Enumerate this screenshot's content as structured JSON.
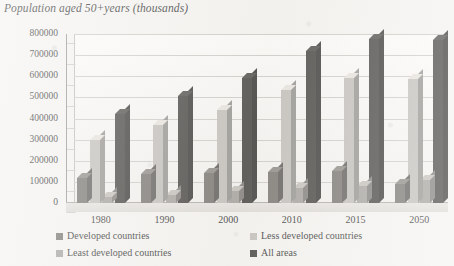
{
  "chart_data": {
    "type": "bar",
    "title": "Population aged 50+years (thousands)",
    "xlabel": "",
    "ylabel": "",
    "ylim": [
      0,
      800000
    ],
    "ytick_step": 100000,
    "grid": true,
    "legend_position": "bottom",
    "style": "3d-clustered-column",
    "categories": [
      "1980",
      "1990",
      "2000",
      "2010",
      "2015",
      "2050"
    ],
    "yticks": [
      "0",
      "100000",
      "200000",
      "300000",
      "400000",
      "500000",
      "600000",
      "700000",
      "800000"
    ],
    "series": [
      {
        "name": "Developed countries",
        "color": "#6a6762",
        "values": [
          120000,
          135000,
          142000,
          146000,
          150000,
          90000
        ]
      },
      {
        "name": "Less developed countries",
        "color": "#bbb8b3",
        "values": [
          300000,
          370000,
          440000,
          535000,
          590000,
          585000
        ]
      },
      {
        "name": "Least developed countries",
        "color": "#9b9893",
        "values": [
          30000,
          40000,
          55000,
          70000,
          80000,
          110000
        ]
      },
      {
        "name": "All areas",
        "color": "#33312e",
        "values": [
          420000,
          505000,
          590000,
          720000,
          775000,
          770000
        ]
      }
    ]
  }
}
